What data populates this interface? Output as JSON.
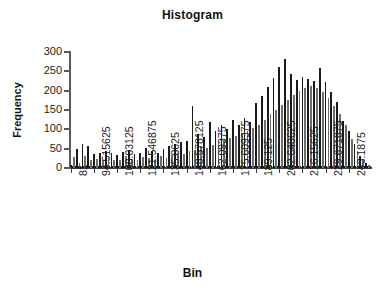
{
  "chart_data": {
    "type": "bar",
    "title": "Histogram",
    "xlabel": "Bin",
    "ylabel": "Frequency",
    "grid": false,
    "legend": false,
    "ylim": [
      0,
      300
    ],
    "yticks": [
      300,
      250,
      200,
      150,
      100,
      50,
      0
    ],
    "ytick_labels": [
      "300",
      "250",
      "200",
      "150",
      "100",
      "50",
      "0"
    ],
    "xtick_labels": [
      "81",
      "94.515625",
      "108.03125",
      "121.546875",
      "135.0625",
      "148.578125",
      "162.09375",
      "175.609375",
      "189.125",
      "202.640625",
      "216.15625",
      "229.671875",
      "243.1875"
    ],
    "xtick_positions": [
      0,
      8,
      16,
      24,
      32,
      40,
      48,
      56,
      64,
      72,
      80,
      88,
      96
    ],
    "bin_width": 1.6894531,
    "bin_start": 81,
    "n_bins": 104,
    "categories": [
      "81",
      "82.689",
      "84.379",
      "86.068",
      "87.758",
      "89.447",
      "91.137",
      "92.826",
      "94.516",
      "96.205",
      "97.895",
      "99.584",
      "101.273",
      "102.963",
      "104.652",
      "106.342",
      "108.031",
      "109.721",
      "111.410",
      "113.100",
      "114.789",
      "116.479",
      "118.168",
      "119.857",
      "121.547",
      "123.236",
      "124.926",
      "126.615",
      "128.305",
      "129.994",
      "131.684",
      "133.373",
      "135.063",
      "136.752",
      "138.441",
      "140.131",
      "141.820",
      "143.510",
      "145.199",
      "146.889",
      "148.578",
      "150.268",
      "151.957",
      "153.646",
      "155.336",
      "157.025",
      "158.715",
      "160.404",
      "162.094",
      "163.783",
      "165.473",
      "167.162",
      "168.852",
      "170.541",
      "172.230",
      "173.920",
      "175.609",
      "177.299",
      "178.988",
      "180.678",
      "182.367",
      "184.057",
      "185.746",
      "187.436",
      "189.125",
      "190.814",
      "192.504",
      "194.193",
      "195.883",
      "197.572",
      "199.262",
      "200.951",
      "202.641",
      "204.330",
      "206.020",
      "207.709",
      "209.398",
      "211.088",
      "212.777",
      "214.467",
      "216.156",
      "217.846",
      "219.535",
      "221.225",
      "222.914",
      "224.604",
      "226.293",
      "227.982",
      "229.672",
      "231.361",
      "233.051",
      "234.740",
      "236.430",
      "238.119",
      "239.809",
      "241.498",
      "243.188",
      "244.877",
      "246.566",
      "248.256",
      "249.945",
      "251.635",
      "253.324",
      "255.014"
    ],
    "values": [
      8,
      28,
      48,
      14,
      62,
      30,
      58,
      20,
      36,
      24,
      40,
      18,
      44,
      26,
      38,
      22,
      34,
      20,
      42,
      30,
      46,
      24,
      36,
      20,
      40,
      28,
      52,
      26,
      44,
      22,
      38,
      30,
      48,
      26,
      58,
      34,
      62,
      40,
      66,
      36,
      70,
      44,
      160,
      46,
      88,
      56,
      80,
      52,
      118,
      60,
      96,
      66,
      110,
      72,
      100,
      78,
      124,
      84,
      112,
      90,
      130,
      96,
      120,
      104,
      168,
      112,
      186,
      124,
      210,
      140,
      232,
      150,
      262,
      164,
      282,
      176,
      244,
      190,
      228,
      200,
      236,
      206,
      230,
      212,
      224,
      208,
      258,
      196,
      222,
      180,
      196,
      160,
      172,
      140,
      122,
      110,
      96,
      74,
      62,
      44,
      32,
      22,
      14,
      8
    ],
    "tail_baseline": 6,
    "colors": {
      "bar_dark": "#1a1a1a",
      "bar_light": "#6e6e6e",
      "axis": "#3c3c3c",
      "text": "#1c1c1c",
      "background": "#ffffff"
    }
  }
}
